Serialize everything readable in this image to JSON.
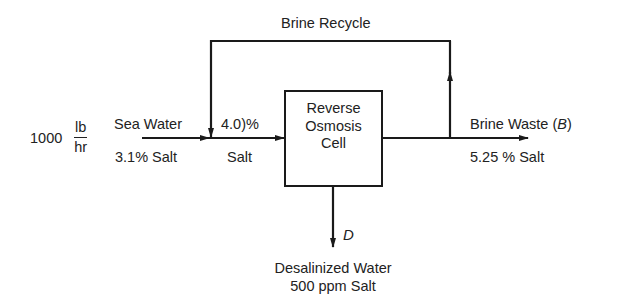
{
  "diagram": {
    "type": "process-flow",
    "feed": {
      "rate_value": "1000",
      "rate_unit_numerator": "lb",
      "rate_unit_denominator": "hr",
      "name": "Sea Water",
      "composition": "3.1% Salt"
    },
    "mixed_stream": {
      "composition_line1": "4.0)%",
      "composition_line2": "Salt"
    },
    "unit": {
      "line1": "Reverse",
      "line2": "Osmosis",
      "line3": "Cell"
    },
    "recycle": {
      "label": "Brine Recycle"
    },
    "brine_waste": {
      "name": "Brine Waste (",
      "symbol": "B",
      "close": ")",
      "composition": "5.25 % Salt"
    },
    "product": {
      "symbol": "D",
      "name": "Desalinized Water",
      "composition": "500 ppm Salt"
    },
    "colors": {
      "line": "#1a1a1a",
      "background": "#ffffff"
    }
  }
}
